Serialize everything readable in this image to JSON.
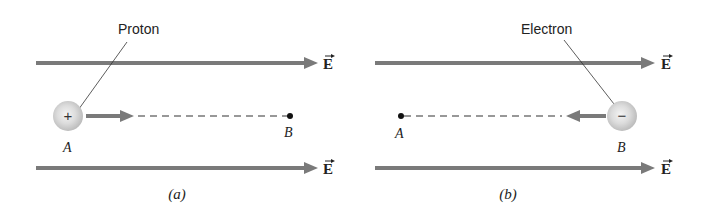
{
  "panels": [
    {
      "id": "a",
      "caption": "(a)",
      "particle": {
        "name": "Proton",
        "sign": "+",
        "start_point": "A",
        "end_point": "B"
      },
      "field_labels": [
        "E",
        "E"
      ],
      "point_labels": {
        "A": "A",
        "B": "B"
      },
      "motion_direction": "right"
    },
    {
      "id": "b",
      "caption": "(b)",
      "particle": {
        "name": "Electron",
        "sign": "−",
        "start_point": "B",
        "end_point": "A"
      },
      "field_labels": [
        "E",
        "E"
      ],
      "point_labels": {
        "A": "A",
        "B": "B"
      },
      "motion_direction": "left"
    }
  ],
  "colors": {
    "field_arrow": "#7a7a7a",
    "particle_fill": "#d8d8d8",
    "dashed_path": "#333333",
    "text": "#222222"
  }
}
